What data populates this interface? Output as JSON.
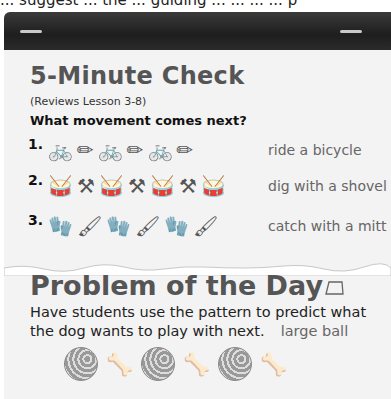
{
  "header": {
    "cut_text": "... suggest ... the ... guiding ... ... ... ... p"
  },
  "five_minute_check": {
    "title": "5-Minute Check",
    "subtitle": "(Reviews Lesson 3-8)",
    "question": "What movement comes next?",
    "items": [
      {
        "number": "1.",
        "pattern": [
          "bicycle-icon",
          "pencil-icon",
          "bicycle-icon",
          "pencil-icon",
          "bicycle-icon",
          "pencil-icon"
        ],
        "answer": "ride a bicycle"
      },
      {
        "number": "2.",
        "pattern": [
          "drum-icon",
          "shovel-icon",
          "drum-icon",
          "shovel-icon",
          "drum-icon",
          "shovel-icon",
          "drum-icon"
        ],
        "answer": "dig with a shovel"
      },
      {
        "number": "3.",
        "pattern": [
          "mitt-icon",
          "paintbrush-icon",
          "mitt-icon",
          "paintbrush-icon",
          "mitt-icon",
          "paintbrush-icon"
        ],
        "answer": "catch with a mitt"
      }
    ]
  },
  "problem_of_the_day": {
    "title": "Problem of the Day",
    "text": "Have students use the pattern to predict what the dog wants to play with next.",
    "answer": "large ball",
    "pattern": [
      "ball-icon",
      "bone-icon",
      "ball-icon",
      "bone-icon",
      "ball-icon",
      "bone-icon"
    ]
  },
  "glyphs": {
    "bicycle": "🚲",
    "pencil": "✏",
    "drum": "🥁",
    "shovel": "⚒",
    "mitt": "🧤",
    "paintbrush": "🖌",
    "bone": "🦴"
  }
}
